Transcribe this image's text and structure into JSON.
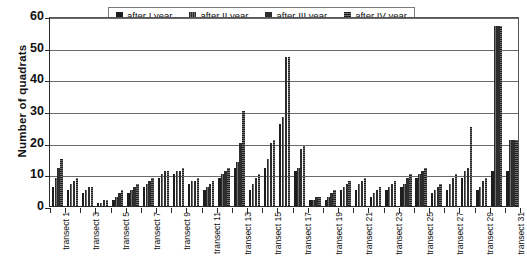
{
  "chart_data": {
    "type": "bar",
    "title": "",
    "xlabel": "",
    "ylabel": "Number of quadrats",
    "ylim": [
      0,
      60
    ],
    "yticks": [
      0,
      10,
      20,
      30,
      40,
      50,
      60
    ],
    "grid": true,
    "legend_position": "top-center",
    "categories": [
      "transect 1",
      "transect 2",
      "transect 3",
      "transect 4",
      "transect 5",
      "transect 6",
      "transect 7",
      "transect 8",
      "transect 9",
      "transect 10",
      "transect 11",
      "transect 12",
      "transect 13",
      "transect 14",
      "transect 15",
      "transect 16",
      "transect 17",
      "transect 18",
      "transect 19",
      "transect 20",
      "transect 21",
      "transect 22",
      "transect 23",
      "transect 24",
      "transect 25",
      "transect 26",
      "transect 27",
      "transect 28",
      "transect 29",
      "transect 30",
      "transect 31"
    ],
    "tick_labels": [
      "transect 1",
      "transect 3",
      "transect 5",
      "transect 7",
      "transect 9",
      "transect 11",
      "transect 13",
      "transect 15",
      "transect 17",
      "transect 19",
      "transect 21",
      "transect 23",
      "transect 25",
      "transect 27",
      "transect 29",
      "transect 31"
    ],
    "series": [
      {
        "name": "after I year",
        "values": [
          6,
          5,
          4,
          1,
          2,
          4,
          6,
          9,
          10,
          7,
          5,
          9,
          12,
          5,
          12,
          26,
          11,
          2,
          2,
          5,
          5,
          3,
          5,
          6,
          9,
          4,
          5,
          9,
          5,
          11,
          11
        ]
      },
      {
        "name": "after II year",
        "values": [
          9,
          7,
          5,
          1,
          3,
          5,
          7,
          10,
          11,
          8,
          6,
          10,
          14,
          7,
          15,
          28,
          12,
          2,
          3,
          6,
          7,
          4,
          6,
          7,
          10,
          5,
          7,
          11,
          6,
          57,
          21
        ]
      },
      {
        "name": "after III year",
        "values": [
          12,
          8,
          6,
          2,
          4,
          6,
          8,
          11,
          11,
          8,
          7,
          11,
          20,
          9,
          20,
          47,
          18,
          3,
          4,
          7,
          8,
          5,
          7,
          9,
          11,
          6,
          9,
          12,
          8,
          57,
          21
        ]
      },
      {
        "name": "after IV year",
        "values": [
          15,
          9,
          6,
          2,
          5,
          7,
          9,
          11,
          12,
          9,
          8,
          12,
          30,
          10,
          21,
          47,
          19,
          3,
          5,
          8,
          9,
          6,
          8,
          10,
          12,
          7,
          10,
          25,
          9,
          57,
          21
        ]
      }
    ]
  },
  "legend": {
    "items": [
      {
        "label": "after I year"
      },
      {
        "label": "after II year"
      },
      {
        "label": "after III year"
      },
      {
        "label": "after IV year"
      }
    ]
  },
  "axes": {
    "y_title": "Number of quadrats"
  }
}
